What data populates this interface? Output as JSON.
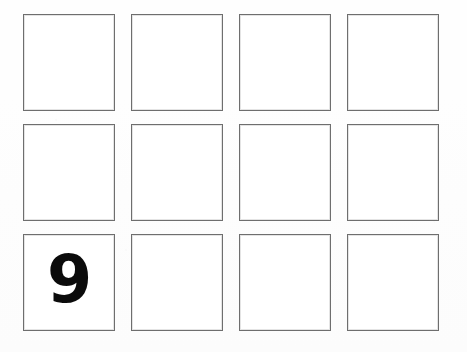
{
  "page": {
    "background_color": "#fefefe",
    "width": 467,
    "height": 352
  },
  "grid": {
    "columns": 4,
    "rows": 3,
    "cell_border_color": "#6e6e6e",
    "cell_fill_color": "#ffffff",
    "digit_color": "#0b0b0b",
    "cells": [
      {
        "row": 1,
        "col": 1,
        "value": ""
      },
      {
        "row": 1,
        "col": 2,
        "value": ""
      },
      {
        "row": 1,
        "col": 3,
        "value": ""
      },
      {
        "row": 1,
        "col": 4,
        "value": ""
      },
      {
        "row": 2,
        "col": 1,
        "value": ""
      },
      {
        "row": 2,
        "col": 2,
        "value": ""
      },
      {
        "row": 2,
        "col": 3,
        "value": ""
      },
      {
        "row": 2,
        "col": 4,
        "value": ""
      },
      {
        "row": 3,
        "col": 1,
        "value": "9"
      },
      {
        "row": 3,
        "col": 2,
        "value": ""
      },
      {
        "row": 3,
        "col": 3,
        "value": ""
      },
      {
        "row": 3,
        "col": 4,
        "value": ""
      }
    ]
  }
}
